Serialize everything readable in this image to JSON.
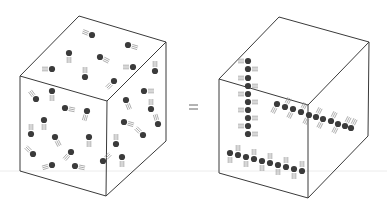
{
  "figure": {
    "equals_sign": "=",
    "colors": {
      "edge": "#3a3a3a",
      "particle": "#3b3b3b",
      "streak": "#8a8a8a",
      "background": "#ffffff"
    }
  },
  "left_cube": {
    "label": "random-distribution-cube",
    "vertices": {
      "top_back": [
        79,
        16
      ],
      "top_right": [
        166,
        42
      ],
      "front_top_left": [
        20,
        76
      ],
      "front_top_right": [
        107,
        101
      ],
      "front_bottom_left": [
        20,
        171
      ],
      "front_bottom_right": [
        106,
        196
      ],
      "right_bottom": [
        166,
        141
      ]
    },
    "particles": [
      [
        92,
        35,
        -1,
        -0.4
      ],
      [
        128,
        45,
        1,
        0.3
      ],
      [
        69,
        53,
        0,
        1
      ],
      [
        100,
        57,
        1,
        0.5
      ],
      [
        52,
        69,
        -1,
        0
      ],
      [
        133,
        67,
        -1,
        0
      ],
      [
        85,
        77,
        0,
        -1
      ],
      [
        114,
        81,
        -1,
        1
      ],
      [
        155,
        71,
        0,
        -1
      ],
      [
        36,
        99,
        -0.6,
        -0.8
      ],
      [
        52,
        91,
        0,
        1
      ],
      [
        65,
        108,
        1,
        0.2
      ],
      [
        87,
        111,
        -0.3,
        1
      ],
      [
        144,
        91,
        1,
        0
      ],
      [
        126,
        100,
        0.4,
        1
      ],
      [
        151,
        109,
        0,
        -1
      ],
      [
        44,
        120,
        0,
        1
      ],
      [
        31,
        134,
        0,
        -1
      ],
      [
        124,
        122,
        1,
        0.3
      ],
      [
        55,
        137,
        0.5,
        1
      ],
      [
        89,
        137,
        0,
        1
      ],
      [
        158,
        124,
        -0.3,
        -1
      ],
      [
        143,
        135,
        -1,
        -1
      ],
      [
        116,
        144,
        0,
        -1
      ],
      [
        33,
        154,
        -0.7,
        -0.7
      ],
      [
        71,
        152,
        -0.7,
        0.8
      ],
      [
        52,
        165,
        -1,
        0.3
      ],
      [
        75,
        166,
        1,
        0.2
      ],
      [
        103,
        161,
        1,
        -1
      ],
      [
        122,
        157,
        0,
        1
      ]
    ]
  },
  "right_cube": {
    "label": "ordered-lines-cube",
    "vertices": {
      "top_back": [
        279,
        17
      ],
      "top_right": [
        369,
        42
      ],
      "front_top_left": [
        219,
        79
      ],
      "front_top_right": [
        308,
        105
      ],
      "front_bottom_left": [
        219,
        173
      ],
      "front_bottom_right": [
        308,
        198
      ],
      "right_bottom": [
        368,
        136
      ]
    },
    "particles": [
      [
        248,
        61,
        -1,
        0
      ],
      [
        248,
        69,
        1,
        0
      ],
      [
        248,
        78,
        -1,
        0
      ],
      [
        248,
        86,
        1,
        0
      ],
      [
        248,
        94,
        -1,
        0
      ],
      [
        248,
        102,
        1,
        0
      ],
      [
        248,
        110,
        -1,
        0
      ],
      [
        248,
        118,
        1,
        0
      ],
      [
        248,
        126,
        -1,
        0
      ],
      [
        248,
        134,
        1,
        0
      ],
      [
        277,
        104,
        -0.5,
        1
      ],
      [
        285,
        107,
        0.5,
        -1
      ],
      [
        293,
        109,
        -0.5,
        1
      ],
      [
        301,
        112,
        0.5,
        -1
      ],
      [
        309,
        115,
        -0.5,
        1
      ],
      [
        316,
        117,
        0.5,
        -1
      ],
      [
        323,
        119,
        -0.5,
        1
      ],
      [
        331,
        121,
        0.5,
        -1
      ],
      [
        338,
        124,
        -0.5,
        1
      ],
      [
        345,
        126,
        0.5,
        -1
      ],
      [
        351,
        128,
        0.5,
        -1
      ],
      [
        230,
        153,
        0,
        1
      ],
      [
        238,
        155,
        0,
        -1
      ],
      [
        246,
        157,
        0,
        1
      ],
      [
        254,
        159,
        0,
        -1
      ],
      [
        262,
        161,
        0,
        1
      ],
      [
        270,
        163,
        0,
        -1
      ],
      [
        278,
        165,
        0,
        1
      ],
      [
        286,
        167,
        0,
        -1
      ],
      [
        294,
        169,
        0,
        1
      ],
      [
        302,
        171,
        0,
        -1
      ]
    ]
  }
}
